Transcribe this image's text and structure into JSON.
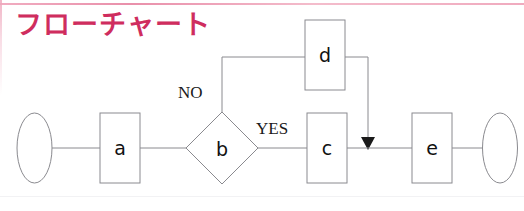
{
  "page": {
    "title": "フローチャート",
    "title_color": "#cf2d5e",
    "background": "#ffffff",
    "accent_rule_color": "#eda3b8",
    "width": 524,
    "height": 211
  },
  "diagram": {
    "type": "flowchart",
    "shape_stroke": "#8a8a8f",
    "shape_fill": "#ffffff",
    "connector_color": "#8a8a8f",
    "nodes": [
      {
        "id": "start",
        "shape": "ellipse",
        "label": "",
        "cx": 34.5,
        "cy": 148,
        "rx": 17.5,
        "ry": 35
      },
      {
        "id": "a",
        "shape": "rectangle",
        "label": "a",
        "x": 100,
        "y": 113,
        "w": 40,
        "h": 70
      },
      {
        "id": "b",
        "shape": "diamond",
        "label": "b",
        "cx": 222,
        "cy": 148,
        "rx": 36,
        "ry": 36
      },
      {
        "id": "c",
        "shape": "rectangle",
        "label": "c",
        "x": 307,
        "y": 113,
        "w": 40,
        "h": 70
      },
      {
        "id": "d",
        "shape": "rectangle",
        "label": "d",
        "x": 305,
        "y": 20,
        "w": 40,
        "h": 70
      },
      {
        "id": "e",
        "shape": "rectangle",
        "label": "e",
        "x": 412,
        "y": 113,
        "w": 40,
        "h": 70
      },
      {
        "id": "end",
        "shape": "ellipse",
        "label": "",
        "cx": 500,
        "cy": 148,
        "rx": 17.5,
        "ry": 35
      }
    ],
    "branch_labels": [
      {
        "id": "no",
        "text": "NO",
        "x": 178,
        "y": 94
      },
      {
        "id": "yes",
        "text": "YES",
        "x": 256,
        "y": 130
      }
    ],
    "edges": [
      {
        "id": "start-a",
        "from": "start",
        "to": "a",
        "path": "M52,148 L100,148",
        "arrow": false
      },
      {
        "id": "a-b",
        "from": "a",
        "to": "b",
        "path": "M140,148 L186,148",
        "arrow": false
      },
      {
        "id": "b-d",
        "from": "b",
        "to": "d",
        "label": "NO",
        "path": "M222,112 L222,57 L305,57",
        "arrow": false
      },
      {
        "id": "b-c",
        "from": "b",
        "to": "c",
        "label": "YES",
        "path": "M258,148 L307,148",
        "arrow": false
      },
      {
        "id": "d-join",
        "from": "d",
        "to": "c-e",
        "path": "M345,57 L368,57 L368,140",
        "arrow": true
      },
      {
        "id": "c-e",
        "from": "c",
        "to": "e",
        "path": "M347,148 L412,148",
        "arrow": false
      },
      {
        "id": "e-end",
        "from": "e",
        "to": "end",
        "path": "M452,148 L482.5,148",
        "arrow": false
      }
    ]
  }
}
